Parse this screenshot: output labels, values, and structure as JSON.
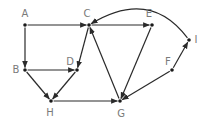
{
  "diagram": {
    "type": "directed-graph",
    "colors": {
      "edge": "#2a2a2a",
      "node": "#1a1a1a",
      "label": "#7a7a7a",
      "background": "#ffffff"
    },
    "nodes": [
      {
        "id": "A",
        "label": "A",
        "x": 25,
        "y": 25,
        "lx": 25,
        "ly": 17
      },
      {
        "id": "C",
        "label": "C",
        "x": 89,
        "y": 25,
        "lx": 87,
        "ly": 17
      },
      {
        "id": "E",
        "label": "E",
        "x": 152,
        "y": 25,
        "lx": 149,
        "ly": 17
      },
      {
        "id": "I",
        "label": "I",
        "x": 189,
        "y": 40,
        "lx": 196,
        "ly": 43
      },
      {
        "id": "B",
        "label": "B",
        "x": 25,
        "y": 70,
        "lx": 16,
        "ly": 73
      },
      {
        "id": "D",
        "label": "D",
        "x": 77,
        "y": 70,
        "lx": 70,
        "ly": 65
      },
      {
        "id": "F",
        "label": "F",
        "x": 172,
        "y": 70,
        "lx": 168,
        "ly": 65
      },
      {
        "id": "H",
        "label": "H",
        "x": 51,
        "y": 101,
        "lx": 50,
        "ly": 116
      },
      {
        "id": "G",
        "label": "G",
        "x": 120,
        "y": 101,
        "lx": 121,
        "ly": 117
      }
    ],
    "edges": [
      {
        "from": "A",
        "to": "C"
      },
      {
        "from": "A",
        "to": "B"
      },
      {
        "from": "C",
        "to": "E"
      },
      {
        "from": "C",
        "to": "D"
      },
      {
        "from": "B",
        "to": "D"
      },
      {
        "from": "B",
        "to": "H"
      },
      {
        "from": "D",
        "to": "H"
      },
      {
        "from": "H",
        "to": "G"
      },
      {
        "from": "G",
        "to": "C"
      },
      {
        "from": "E",
        "to": "G"
      },
      {
        "from": "F",
        "to": "G"
      },
      {
        "from": "F",
        "to": "I"
      },
      {
        "from": "I",
        "to": "C",
        "curve": {
          "cx": 150,
          "cy": -12
        }
      }
    ]
  }
}
